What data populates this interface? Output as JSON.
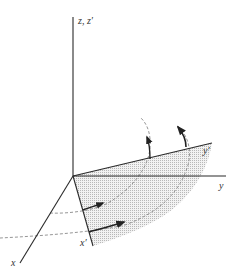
{
  "diagram": {
    "type": "coordinate-rotation",
    "labels": {
      "z_axis": "z, z′",
      "y_axis": "y",
      "y_prime_axis": "y′",
      "x_axis": "x",
      "x_prime_axis": "x′"
    },
    "colors": {
      "axis": "#2a2a2a",
      "dashed_arc": "#888888",
      "shading": "#d9d9d9",
      "arrow": "#222222",
      "label": "#333333"
    }
  }
}
